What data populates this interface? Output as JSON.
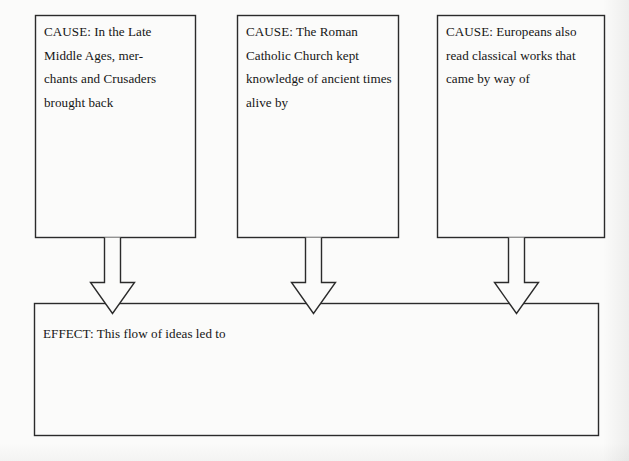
{
  "diagram": {
    "type": "cause-and-effect-organizer",
    "stroke_color": "#2b2b2b",
    "background_color": "#fbfbfa",
    "text_color": "#151515",
    "causes": [
      {
        "id": "cause-1",
        "label": "CAUSE: In the Late Middle Ages, mer-\nchants and Crusaders brought back",
        "text": "CAUSE: In the Late Middle Ages, mer-chants and Crusaders brought back"
      },
      {
        "id": "cause-2",
        "label": "CAUSE: The Roman Catholic Church kept knowledge of ancient times alive by",
        "text": "CAUSE: The Roman Catholic Church kept knowledge of ancient times alive by"
      },
      {
        "id": "cause-3",
        "label": "CAUSE: Europeans also read classical works that came by way of",
        "text": "CAUSE: Europeans also read classical works that came by way of"
      }
    ],
    "effect": {
      "id": "effect-1",
      "label": "EFFECT: This flow of ideas led to"
    },
    "arrows": [
      {
        "id": "arrow-1",
        "from": "cause-1",
        "to": "effect-1",
        "direction": "down"
      },
      {
        "id": "arrow-2",
        "from": "cause-2",
        "to": "effect-1",
        "direction": "down"
      },
      {
        "id": "arrow-3",
        "from": "cause-3",
        "to": "effect-1",
        "direction": "down"
      }
    ]
  }
}
